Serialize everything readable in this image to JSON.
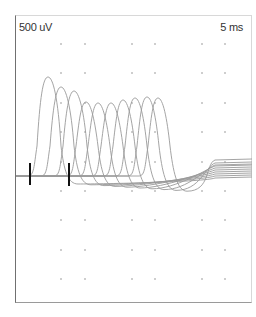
{
  "chart_data": {
    "type": "line",
    "title": "",
    "amplitude_scale": "500 uV",
    "time_scale": "5 ms",
    "grid": {
      "style": "dots",
      "x": [
        61,
        85,
        132,
        155,
        202,
        225
      ],
      "y": [
        44,
        73,
        103,
        132,
        162,
        191,
        220,
        250,
        279
      ]
    },
    "baseline_y": 176,
    "stimulus_markers": [
      {
        "x": 30,
        "y1": 163,
        "y2": 185
      },
      {
        "x": 69,
        "y1": 163,
        "y2": 186
      }
    ],
    "series": [
      {
        "name": "trace-1",
        "onset": 36,
        "peak_x": 48,
        "peak_y": 77,
        "end_y": 178
      },
      {
        "name": "trace-2",
        "onset": 49,
        "peak_x": 61,
        "peak_y": 87,
        "end_y": 176
      },
      {
        "name": "trace-3",
        "onset": 62,
        "peak_x": 74,
        "peak_y": 91,
        "end_y": 174
      },
      {
        "name": "trace-4",
        "onset": 75,
        "peak_x": 86,
        "peak_y": 102,
        "end_y": 172
      },
      {
        "name": "trace-5",
        "onset": 87,
        "peak_x": 98,
        "peak_y": 103,
        "end_y": 170
      },
      {
        "name": "trace-6",
        "onset": 100,
        "peak_x": 111,
        "peak_y": 103,
        "end_y": 168
      },
      {
        "name": "trace-7",
        "onset": 112,
        "peak_x": 123,
        "peak_y": 100,
        "end_y": 166
      },
      {
        "name": "trace-8",
        "onset": 124,
        "peak_x": 135,
        "peak_y": 98,
        "end_y": 165
      },
      {
        "name": "trace-9",
        "onset": 136,
        "peak_x": 147,
        "peak_y": 97,
        "end_y": 163
      },
      {
        "name": "trace-10",
        "onset": 147,
        "peak_x": 158,
        "peak_y": 98,
        "end_y": 160
      }
    ],
    "xlabel": "",
    "ylabel": ""
  },
  "labels": {
    "amplitude": "500 uV",
    "time": "5 ms"
  },
  "colors": {
    "trace": "#9a9a9a",
    "grid_dot": "#a8a8a8",
    "marker": "#111111",
    "frame": "#707070"
  }
}
